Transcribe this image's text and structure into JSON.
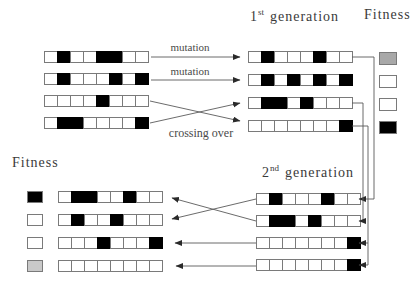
{
  "labels": {
    "mutation_1": "mutation",
    "mutation_2": "mutation",
    "crossing_over": "crossing over",
    "fitness_top": "Fitness",
    "fitness_bottom": "Fitness",
    "gen1": {
      "number": "1",
      "suffix": "st",
      "word": "generation"
    },
    "gen2": {
      "number": "2",
      "suffix": "nd",
      "word": "generation"
    }
  },
  "colors": {
    "cell_on": "#000000",
    "cell_off": "#ffffff",
    "fitness_black": "#000000",
    "fitness_white": "#ffffff",
    "fitness_gray": "#a8a8a8",
    "fitness_lightgray": "#c9c9c9"
  },
  "chromosomes": {
    "initial": [
      "01001100",
      "01000101",
      "00001000",
      "01100001"
    ],
    "first_generation": [
      "01000100",
      "01010101",
      "01101000",
      "00000001"
    ],
    "second_generation": [
      "01000100",
      "01101000",
      "00000001",
      "00000001"
    ],
    "evaluated": [
      "01100100",
      "01001000",
      "00010001",
      "00000000"
    ]
  },
  "fitness": {
    "first_generation": [
      "gray",
      "white",
      "white",
      "black"
    ],
    "evaluated": [
      "black",
      "white",
      "white",
      "lightgray"
    ]
  }
}
